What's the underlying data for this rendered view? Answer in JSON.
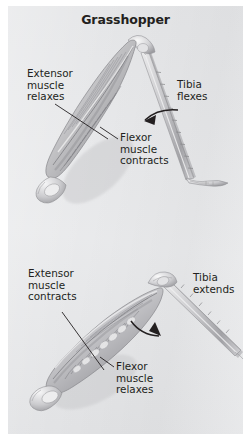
{
  "figure": {
    "title": "Grasshopper",
    "background_color": "#e6e7e9",
    "page_color": "#ffffff",
    "ink_color": "#231f20"
  },
  "panels": [
    {
      "id": "flexed",
      "state": "leg flexed",
      "labels": {
        "extensor": "Extensor\nmuscle\nrelaxes",
        "flexor": "Flexor\nmuscle\ncontracts",
        "tibia": "Tibia\nflexes"
      }
    },
    {
      "id": "extended",
      "state": "leg extended",
      "labels": {
        "extensor": "Extensor\nmuscle\ncontracts",
        "flexor": "Flexor\nmuscle\nrelaxes",
        "tibia": "Tibia\nextends"
      }
    }
  ],
  "labels_flat": {
    "top_extensor": "Extensor\nmuscle\nrelaxes",
    "top_flexor": "Flexor\nmuscle\ncontracts",
    "top_tibia": "Tibia\nflexes",
    "bottom_extensor": "Extensor\nmuscle\ncontracts",
    "bottom_flexor": "Flexor\nmuscle\nrelaxes",
    "bottom_tibia": "Tibia\nextends"
  }
}
